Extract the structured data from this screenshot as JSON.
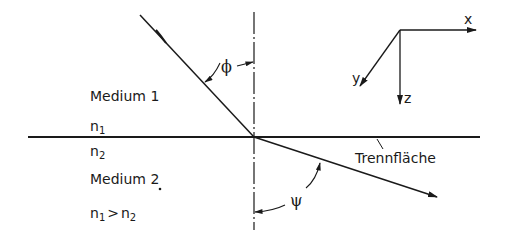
{
  "diagram": {
    "medium1": {
      "label": "Medium 1",
      "index": "n",
      "index_sub": "1"
    },
    "medium2": {
      "label": "Medium 2",
      "index": "n",
      "index_sub": "2"
    },
    "condition": {
      "left": "n",
      "left_sub": "1",
      "op": ">",
      "right": "n",
      "right_sub": "2"
    },
    "interface_label": "Trennfläche",
    "angle_incidence": "ϕ",
    "angle_refraction": "ψ",
    "axes": {
      "x": "x",
      "y": "y",
      "z": "z"
    },
    "colors": {
      "ink": "#1a1a1a",
      "background": "#ffffff"
    }
  }
}
